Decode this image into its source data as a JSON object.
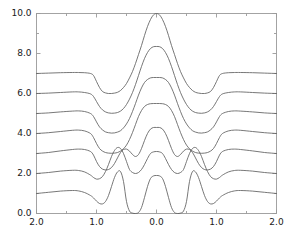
{
  "chart_data": {
    "type": "line",
    "title": "",
    "xlabel": "",
    "ylabel": "",
    "xlim": [
      0,
      1
    ],
    "ylim": [
      0.0,
      10.0
    ],
    "grid": false,
    "legend": null,
    "x_tick_labels": [
      "2.0",
      "1.0",
      "0.0",
      "1.0",
      "2.0"
    ],
    "x_tick_positions": [
      0.0,
      0.25,
      0.5,
      0.75,
      1.0
    ],
    "y_tick_labels": [
      "0.0",
      "2.0",
      "4.0",
      "6.0",
      "8.0",
      "10.0"
    ],
    "y_tick_values": [
      0.0,
      2.0,
      4.0,
      6.0,
      8.0,
      10.0
    ],
    "axis_note": "x axis is mirrored: runs 2.0 -> 1.0 -> 0.0 -> 1.0 -> 2.0",
    "line_color": "#606060",
    "axis_color": "#9a9a9a",
    "background_color": "#ffffff",
    "offset_step": 1.0,
    "series_count": 7,
    "x": [
      -2.0,
      -1.8,
      -1.6,
      -1.4,
      -1.3,
      -1.2,
      -1.1,
      -1.05,
      -1.0,
      -0.95,
      -0.9,
      -0.85,
      -0.8,
      -0.75,
      -0.7,
      -0.65,
      -0.6,
      -0.55,
      -0.5,
      -0.45,
      -0.4,
      -0.35,
      -0.3,
      -0.25,
      -0.2,
      -0.15,
      -0.1,
      -0.05,
      0.0,
      0.05,
      0.1,
      0.15,
      0.2,
      0.25,
      0.3,
      0.35,
      0.4,
      0.45,
      0.5,
      0.55,
      0.6,
      0.65,
      0.7,
      0.75,
      0.8,
      0.85,
      0.9,
      0.95,
      1.0,
      1.05,
      1.1,
      1.2,
      1.3,
      1.4,
      1.6,
      1.8,
      2.0
    ],
    "series": [
      {
        "name": "curve-7",
        "baseline": 7.0,
        "peak_center": 10.0,
        "values": [
          7.0,
          7.02,
          7.04,
          7.05,
          7.05,
          7.04,
          7.0,
          6.9,
          6.6,
          6.3,
          6.1,
          6.03,
          6.0,
          6.0,
          6.02,
          6.06,
          6.15,
          6.3,
          6.5,
          6.78,
          7.1,
          7.5,
          7.95,
          8.4,
          8.9,
          9.35,
          9.7,
          9.93,
          10.0,
          9.93,
          9.7,
          9.35,
          8.9,
          8.4,
          7.95,
          7.5,
          7.1,
          6.78,
          6.5,
          6.3,
          6.15,
          6.06,
          6.02,
          6.0,
          6.0,
          6.03,
          6.1,
          6.3,
          6.6,
          6.9,
          7.0,
          7.04,
          7.05,
          7.05,
          7.04,
          7.02,
          7.0
        ]
      },
      {
        "name": "curve-6",
        "baseline": 6.0,
        "peak_center": 8.35,
        "values": [
          6.0,
          6.02,
          6.05,
          6.08,
          6.08,
          6.05,
          5.98,
          5.85,
          5.6,
          5.35,
          5.18,
          5.08,
          5.03,
          5.01,
          5.02,
          5.05,
          5.12,
          5.25,
          5.45,
          5.72,
          6.05,
          6.45,
          6.9,
          7.35,
          7.75,
          8.05,
          8.25,
          8.34,
          8.35,
          8.34,
          8.25,
          8.05,
          7.75,
          7.35,
          6.9,
          6.45,
          6.05,
          5.72,
          5.45,
          5.25,
          5.12,
          5.05,
          5.02,
          5.01,
          5.03,
          5.08,
          5.18,
          5.35,
          5.6,
          5.85,
          5.98,
          6.05,
          6.08,
          6.08,
          6.05,
          6.02,
          6.0
        ]
      },
      {
        "name": "curve-5",
        "baseline": 5.0,
        "peak_center": 6.8,
        "values": [
          5.0,
          5.03,
          5.08,
          5.12,
          5.13,
          5.1,
          5.0,
          4.85,
          4.58,
          4.33,
          4.18,
          4.08,
          4.04,
          4.02,
          4.03,
          4.07,
          4.14,
          4.28,
          4.48,
          4.75,
          5.1,
          5.5,
          5.92,
          6.28,
          6.55,
          6.7,
          6.78,
          6.8,
          6.8,
          6.8,
          6.78,
          6.7,
          6.55,
          6.28,
          5.92,
          5.5,
          5.1,
          4.75,
          4.48,
          4.28,
          4.14,
          4.07,
          4.03,
          4.02,
          4.04,
          4.08,
          4.18,
          4.33,
          4.58,
          4.85,
          5.0,
          5.1,
          5.13,
          5.12,
          5.08,
          5.03,
          5.0
        ]
      },
      {
        "name": "curve-4",
        "baseline": 4.0,
        "peak_center": 5.5,
        "values": [
          4.0,
          4.04,
          4.1,
          4.16,
          4.17,
          4.13,
          4.0,
          3.8,
          3.5,
          3.25,
          3.12,
          3.05,
          3.02,
          3.01,
          3.02,
          3.05,
          3.12,
          3.24,
          3.42,
          3.7,
          4.05,
          4.45,
          4.85,
          5.15,
          5.35,
          5.45,
          5.49,
          5.5,
          5.5,
          5.5,
          5.49,
          5.45,
          5.35,
          5.15,
          4.85,
          4.45,
          4.05,
          3.7,
          3.42,
          3.24,
          3.12,
          3.05,
          3.02,
          3.01,
          3.02,
          3.05,
          3.12,
          3.25,
          3.5,
          3.8,
          4.0,
          4.13,
          4.17,
          4.16,
          4.1,
          4.04,
          4.0
        ]
      },
      {
        "name": "curve-3",
        "baseline": 3.0,
        "peak_center": 4.3,
        "values": [
          3.0,
          3.05,
          3.13,
          3.2,
          3.22,
          3.2,
          3.1,
          2.92,
          2.6,
          2.35,
          2.22,
          2.18,
          2.2,
          2.3,
          2.5,
          2.78,
          3.05,
          3.2,
          3.22,
          3.12,
          2.95,
          2.85,
          2.95,
          3.25,
          3.65,
          4.0,
          4.22,
          4.3,
          4.3,
          4.3,
          4.22,
          4.0,
          3.65,
          3.25,
          2.95,
          2.85,
          2.95,
          3.12,
          3.22,
          3.2,
          3.05,
          2.78,
          2.5,
          2.3,
          2.2,
          2.18,
          2.22,
          2.35,
          2.6,
          2.92,
          3.1,
          3.2,
          3.22,
          3.2,
          3.13,
          3.05,
          3.0
        ]
      },
      {
        "name": "curve-2",
        "baseline": 2.0,
        "peak_center": 3.1,
        "values": [
          2.0,
          2.05,
          2.12,
          2.16,
          2.15,
          2.08,
          1.92,
          1.8,
          1.72,
          1.74,
          1.85,
          2.1,
          2.45,
          2.85,
          3.15,
          3.3,
          3.25,
          3.0,
          2.6,
          2.2,
          2.05,
          2.0,
          2.05,
          2.2,
          2.45,
          2.75,
          3.0,
          3.08,
          3.1,
          3.08,
          3.0,
          2.75,
          2.45,
          2.2,
          2.05,
          2.0,
          2.05,
          2.2,
          2.6,
          3.0,
          3.25,
          3.3,
          3.15,
          2.85,
          2.45,
          2.1,
          1.85,
          1.74,
          1.72,
          1.8,
          1.92,
          2.08,
          2.15,
          2.16,
          2.12,
          2.05,
          2.0
        ]
      },
      {
        "name": "curve-1",
        "baseline": 1.0,
        "peak_center": 1.9,
        "values": [
          1.0,
          1.06,
          1.12,
          1.15,
          1.13,
          1.05,
          0.9,
          0.78,
          0.62,
          0.5,
          0.48,
          0.6,
          0.9,
          1.35,
          1.8,
          2.08,
          2.1,
          1.6,
          0.6,
          0.12,
          0.02,
          0.0,
          0.05,
          0.3,
          0.8,
          1.35,
          1.75,
          1.88,
          1.9,
          1.88,
          1.75,
          1.35,
          0.8,
          0.3,
          0.05,
          0.0,
          0.02,
          0.12,
          0.6,
          1.6,
          2.1,
          2.08,
          1.8,
          1.35,
          0.9,
          0.6,
          0.48,
          0.5,
          0.62,
          0.78,
          0.9,
          1.05,
          1.13,
          1.15,
          1.12,
          1.06,
          1.0
        ]
      }
    ]
  },
  "axes": {
    "y_ticks": [
      {
        "label": "10.0",
        "value": 10.0
      },
      {
        "label": "8.0",
        "value": 8.0
      },
      {
        "label": "6.0",
        "value": 6.0
      },
      {
        "label": "4.0",
        "value": 4.0
      },
      {
        "label": "2.0",
        "value": 2.0
      },
      {
        "label": "0.0",
        "value": 0.0
      }
    ],
    "x_ticks": [
      {
        "label": "2.0",
        "pos": 0.0
      },
      {
        "label": "1.0",
        "pos": 0.25
      },
      {
        "label": "0.0",
        "pos": 0.5
      },
      {
        "label": "1.0",
        "pos": 0.75
      },
      {
        "label": "2.0",
        "pos": 1.0
      }
    ]
  }
}
